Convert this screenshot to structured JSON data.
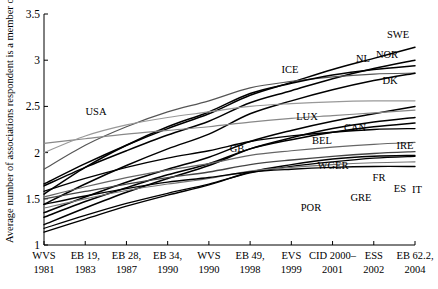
{
  "chart_data": {
    "type": "line",
    "title": "",
    "xlabel": "",
    "ylabel": "Average number of associations respondent is a member of",
    "ylim": [
      1,
      3.5
    ],
    "yticks": [
      1,
      1.5,
      2,
      2.5,
      3,
      3.5
    ],
    "ytick_labels": [
      "1",
      "1.5",
      "2",
      "2.5",
      "3",
      "3.5"
    ],
    "grid": false,
    "legend": "inline-end-labels",
    "categories": [
      "WVS 1981",
      "EB 19, 1983",
      "EB 28, 1987",
      "EB 34, 1990",
      "WVS 1990",
      "EB 49, 1998",
      "EVS 1999",
      "CID 2000–2001",
      "ESS 2002",
      "EB 62.2, 2004"
    ],
    "xtick_lines": [
      [
        "WVS",
        "1981"
      ],
      [
        "EB 19,",
        "1983"
      ],
      [
        "EB 28,",
        "1987"
      ],
      [
        "EB 34,",
        "1990"
      ],
      [
        "WVS",
        "1990"
      ],
      [
        "EB 49,",
        "1998"
      ],
      [
        "EVS",
        "1999"
      ],
      [
        "CID 2000–",
        "2001"
      ],
      [
        "ESS",
        "2002"
      ],
      [
        "EB 62.2,",
        "2004"
      ]
    ],
    "series": [
      {
        "name": "SWE",
        "color": "#000000",
        "width": 1.5,
        "values": [
          1.66,
          1.88,
          2.08,
          2.26,
          2.42,
          2.62,
          2.76,
          2.9,
          3.02,
          3.14
        ]
      },
      {
        "name": "NOR",
        "color": "#000000",
        "width": 1.5,
        "values": [
          1.64,
          1.84,
          2.02,
          2.19,
          2.34,
          2.54,
          2.67,
          2.8,
          2.91,
          3.0
        ]
      },
      {
        "name": "NL",
        "color": "#555555",
        "width": 1.2,
        "values": [
          1.82,
          2.08,
          2.28,
          2.44,
          2.56,
          2.7,
          2.77,
          2.82,
          2.85,
          2.86
        ]
      },
      {
        "name": "ICE",
        "color": "#000000",
        "width": 1.5,
        "values": [
          1.55,
          1.84,
          2.08,
          2.28,
          2.44,
          2.64,
          2.75,
          2.84,
          2.9,
          2.94
        ]
      },
      {
        "name": "DK",
        "color": "#000000",
        "width": 1.5,
        "values": [
          1.44,
          1.66,
          1.86,
          2.04,
          2.2,
          2.42,
          2.56,
          2.68,
          2.78,
          2.86
        ]
      },
      {
        "name": "LUX",
        "color": "#000000",
        "width": 1.5,
        "values": [
          1.35,
          1.52,
          1.68,
          1.82,
          1.95,
          2.12,
          2.24,
          2.34,
          2.42,
          2.5
        ]
      },
      {
        "name": "CAN",
        "color": "#888888",
        "width": 1.2,
        "values": [
          2.1,
          2.15,
          2.2,
          2.24,
          2.28,
          2.33,
          2.37,
          2.4,
          2.43,
          2.46
        ]
      },
      {
        "name": "USA",
        "color": "#999999",
        "width": 1.2,
        "values": [
          2.0,
          2.18,
          2.3,
          2.38,
          2.44,
          2.5,
          2.53,
          2.55,
          2.56,
          2.56
        ]
      },
      {
        "name": "BEL",
        "color": "#000000",
        "width": 1.5,
        "values": [
          1.3,
          1.47,
          1.62,
          1.76,
          1.88,
          2.04,
          2.14,
          2.22,
          2.28,
          2.32
        ]
      },
      {
        "name": "IRE",
        "color": "#000000",
        "width": 1.5,
        "values": [
          1.22,
          1.4,
          1.57,
          1.72,
          1.86,
          2.04,
          2.16,
          2.26,
          2.33,
          2.38
        ]
      },
      {
        "name": "GB",
        "color": "#000000",
        "width": 1.3,
        "values": [
          1.58,
          1.72,
          1.84,
          1.94,
          2.02,
          2.12,
          2.18,
          2.22,
          2.25,
          2.26
        ]
      },
      {
        "name": "WGER",
        "color": "#666666",
        "width": 1.2,
        "values": [
          1.52,
          1.63,
          1.73,
          1.81,
          1.88,
          1.97,
          2.02,
          2.06,
          2.09,
          2.11
        ]
      },
      {
        "name": "FR",
        "color": "#444444",
        "width": 1.3,
        "values": [
          1.5,
          1.58,
          1.66,
          1.73,
          1.79,
          1.87,
          1.92,
          1.96,
          1.99,
          2.01
        ]
      },
      {
        "name": "ES",
        "color": "#000000",
        "width": 1.4,
        "values": [
          1.14,
          1.28,
          1.42,
          1.54,
          1.65,
          1.79,
          1.87,
          1.93,
          1.96,
          1.97
        ]
      },
      {
        "name": "IT",
        "color": "#000000",
        "width": 1.3,
        "values": [
          1.18,
          1.32,
          1.45,
          1.56,
          1.66,
          1.78,
          1.85,
          1.9,
          1.94,
          1.96
        ]
      },
      {
        "name": "GRE",
        "color": "#777777",
        "width": 1.2,
        "values": [
          1.4,
          1.5,
          1.59,
          1.66,
          1.72,
          1.8,
          1.84,
          1.87,
          1.89,
          1.9
        ]
      },
      {
        "name": "POR",
        "color": "#000000",
        "width": 1.4,
        "values": [
          1.44,
          1.53,
          1.61,
          1.68,
          1.73,
          1.79,
          1.82,
          1.84,
          1.85,
          1.85
        ]
      }
    ],
    "series_label_positions": [
      {
        "name": "SWE",
        "x": 398,
        "y": 38
      },
      {
        "name": "NOR",
        "x": 387,
        "y": 58
      },
      {
        "name": "NL",
        "x": 363,
        "y": 62
      },
      {
        "name": "ICE",
        "x": 290,
        "y": 73
      },
      {
        "name": "DK",
        "x": 390,
        "y": 84
      },
      {
        "name": "LUX",
        "x": 307,
        "y": 120
      },
      {
        "name": "CAN",
        "x": 355,
        "y": 131
      },
      {
        "name": "USA",
        "x": 96,
        "y": 115
      },
      {
        "name": "BEL",
        "x": 322,
        "y": 144
      },
      {
        "name": "IRE",
        "x": 405,
        "y": 149
      },
      {
        "name": "GB",
        "x": 237,
        "y": 152
      },
      {
        "name": "WGER",
        "x": 333,
        "y": 169
      },
      {
        "name": "FR",
        "x": 379,
        "y": 181
      },
      {
        "name": "ES",
        "x": 400,
        "y": 192
      },
      {
        "name": "IT",
        "x": 417,
        "y": 193
      },
      {
        "name": "GRE",
        "x": 361,
        "y": 201
      },
      {
        "name": "POR",
        "x": 311,
        "y": 211
      }
    ]
  }
}
